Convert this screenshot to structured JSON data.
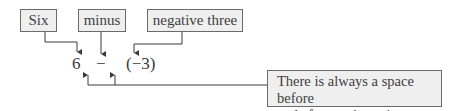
{
  "labels": {
    "six": "Six",
    "minus": "minus",
    "negative_three": "negative three"
  },
  "expression": {
    "operand_left": "6",
    "operator": "−",
    "operand_right": "(−3)"
  },
  "note": {
    "line1": "There is always a space before",
    "line2": "and after a minus sign."
  },
  "colors": {
    "box_fill": "#efefef",
    "box_border": "#6b6b6b",
    "line": "#3a3a3a",
    "text": "#404040"
  }
}
